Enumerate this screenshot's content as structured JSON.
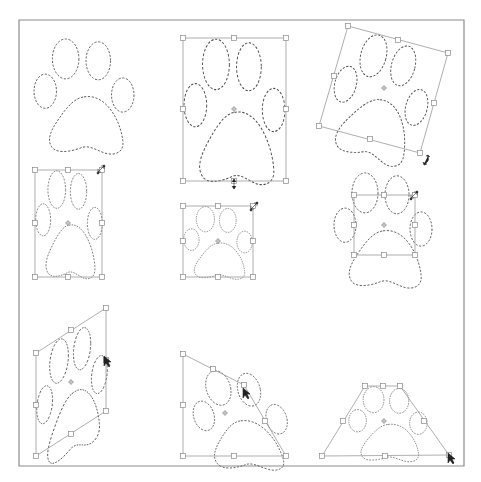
{
  "figure": {
    "colors": {
      "background": "#ffffff",
      "frame": "#8c8c8c",
      "marquee": "#4a4a4a",
      "bounding_box": "#9a9a9a",
      "handle_fill": "#ffffff",
      "cursor": "#222222"
    },
    "panels": [
      {
        "id": "original",
        "label": "",
        "row": 1,
        "col": 1,
        "transform": "none",
        "has_bbox": false
      },
      {
        "id": "scale-vertical",
        "label": "",
        "row": 1,
        "col": 2,
        "transform": "scale",
        "has_bbox": true,
        "cursor": "scale-vertical-cursor"
      },
      {
        "id": "rotate",
        "label": "",
        "row": 1,
        "col": 3,
        "transform": "rotate",
        "has_bbox": true,
        "cursor": "rotate-cursor"
      },
      {
        "id": "scale-corner",
        "label": "",
        "row": 2,
        "col": 1,
        "transform": "scale",
        "has_bbox": true,
        "cursor": "scale-diagonal-cursor"
      },
      {
        "id": "scale-proportional",
        "label": "",
        "row": 2,
        "col": 2,
        "transform": "scale",
        "has_bbox": true,
        "cursor": "scale-diagonal-cursor"
      },
      {
        "id": "scale-shrunk-bbox",
        "label": "",
        "row": 2,
        "col": 3,
        "transform": "scale",
        "has_bbox": true,
        "cursor": "scale-diagonal-cursor"
      },
      {
        "id": "skew",
        "label": "",
        "row": 3,
        "col": 1,
        "transform": "skew",
        "has_bbox": true,
        "cursor": "skew-arrow-cursor"
      },
      {
        "id": "distort",
        "label": "",
        "row": 3,
        "col": 2,
        "transform": "distort",
        "has_bbox": true,
        "cursor": "distort-arrow-cursor"
      },
      {
        "id": "perspective",
        "label": "",
        "row": 3,
        "col": 3,
        "transform": "perspective",
        "has_bbox": true,
        "cursor": "perspective-arrow-cursor"
      }
    ]
  }
}
